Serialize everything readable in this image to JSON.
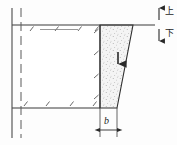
{
  "figure": {
    "background_color": "#fdfdfd",
    "line_color": "#3a3a3a",
    "fill_color": "#f2f2f2",
    "stipple_color": "#7a7a7a"
  },
  "labels": {
    "width_dimension": "b",
    "direction_up": "上",
    "direction_down": "下"
  },
  "geometry": {
    "top_surface_y": 25,
    "bottom_surface_y": 108,
    "break_line_solid_x": 12,
    "break_line_dashed_x": 21,
    "wedge_top_left_x": 100,
    "wedge_top_right_x": 133,
    "wedge_bottom_left_x": 100,
    "wedge_bottom_right_x": 117,
    "dimension_line_y": 130
  },
  "annotations": {
    "load_arrow": "downward-load-arrow",
    "up_arrow": "up-arrow",
    "down_arrow": "down-arrow",
    "dimension_arrows": "horizontal-dimension-arrows"
  }
}
